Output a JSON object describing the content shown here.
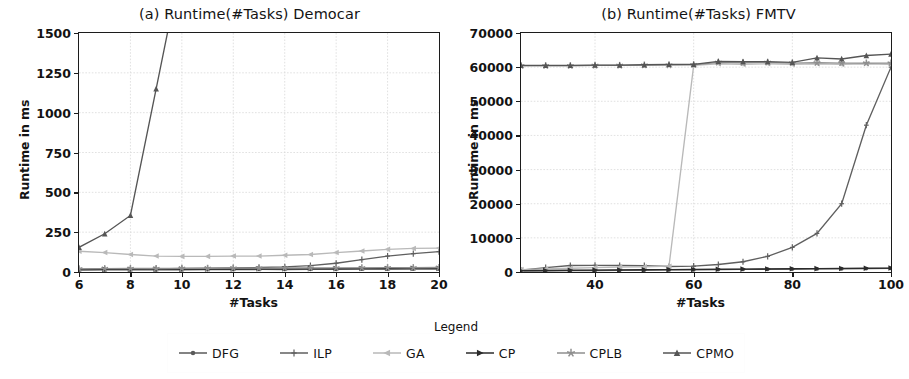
{
  "figure": {
    "legend": {
      "title": "Legend",
      "entries": [
        {
          "label": "DFG",
          "marker": "circle-marker",
          "color": "#5a5a5a"
        },
        {
          "label": "ILP",
          "marker": "plus-marker",
          "color": "#5f5f5f"
        },
        {
          "label": "GA",
          "marker": "triangle-left-marker",
          "color": "#b9b9b9"
        },
        {
          "label": "CP",
          "marker": "triangle-right-marker",
          "color": "#2b2b2b"
        },
        {
          "label": "CPLB",
          "marker": "star-marker",
          "color": "#8f8f8f"
        },
        {
          "label": "CPMO",
          "marker": "triangle-up-marker",
          "color": "#555555"
        }
      ]
    }
  },
  "chart_data": [
    {
      "id": "panel-a",
      "type": "line",
      "title": "(a) Runtime(#Tasks) Democar",
      "xlabel": "#Tasks",
      "ylabel": "Runtime in ms",
      "xlim": [
        6,
        20
      ],
      "ylim": [
        0,
        1500
      ],
      "xticks": [
        6,
        8,
        10,
        12,
        14,
        16,
        18,
        20
      ],
      "yticks": [
        0,
        250,
        500,
        750,
        1000,
        1250,
        1500
      ],
      "grid": true,
      "legend_position": "below-figure",
      "x": [
        6,
        7,
        8,
        9,
        10,
        11,
        12,
        13,
        14,
        15,
        16,
        17,
        18,
        19,
        20
      ],
      "series": [
        {
          "name": "DFG",
          "marker": "circle-marker",
          "color": "#5a5a5a",
          "values": [
            12,
            13,
            13,
            14,
            14,
            15,
            15,
            16,
            16,
            17,
            17,
            18,
            18,
            19,
            19
          ]
        },
        {
          "name": "ILP",
          "marker": "plus-marker",
          "color": "#5f5f5f",
          "values": [
            15,
            17,
            18,
            20,
            22,
            24,
            26,
            28,
            32,
            40,
            55,
            78,
            100,
            115,
            128
          ]
        },
        {
          "name": "GA",
          "marker": "triangle-left-marker",
          "color": "#b9b9b9",
          "values": [
            130,
            122,
            110,
            100,
            98,
            98,
            100,
            100,
            105,
            110,
            122,
            132,
            142,
            148,
            150
          ]
        },
        {
          "name": "CP",
          "marker": "triangle-right-marker",
          "color": "#2b2b2b",
          "values": [
            16,
            17,
            17,
            18,
            18,
            19,
            19,
            20,
            20,
            21,
            21,
            22,
            22,
            23,
            23
          ]
        },
        {
          "name": "CPLB",
          "marker": "star-marker",
          "color": "#8f8f8f",
          "values": [
            20,
            21,
            22,
            22,
            23,
            23,
            24,
            24,
            25,
            25,
            26,
            26,
            27,
            27,
            28
          ]
        },
        {
          "name": "CPMO",
          "marker": "triangle-up-marker",
          "color": "#555555",
          "values": [
            155,
            240,
            355,
            1150,
            null,
            null,
            null,
            null,
            null,
            null,
            null,
            null,
            null,
            null,
            null
          ]
        }
      ],
      "notes": "CPMO exceeds the 1500 ms axis maximum beyond #Tasks 9."
    },
    {
      "id": "panel-b",
      "type": "line",
      "title": "(b) Runtime(#Tasks) FMTV",
      "xlabel": "#Tasks",
      "ylabel": "Runtime in ms",
      "xlim": [
        25,
        100
      ],
      "ylim": [
        0,
        70000
      ],
      "xticks": [
        40,
        60,
        80,
        100
      ],
      "yticks": [
        0,
        10000,
        20000,
        30000,
        40000,
        50000,
        60000,
        70000
      ],
      "grid": true,
      "legend_position": "below-figure",
      "x": [
        25,
        30,
        35,
        40,
        45,
        50,
        55,
        60,
        65,
        70,
        75,
        80,
        85,
        90,
        95,
        100
      ],
      "series": [
        {
          "name": "DFG",
          "marker": "circle-marker",
          "color": "#5a5a5a",
          "values": [
            300,
            350,
            400,
            450,
            500,
            550,
            600,
            650,
            700,
            750,
            800,
            850,
            900,
            950,
            1000,
            1050
          ]
        },
        {
          "name": "ILP",
          "marker": "plus-marker",
          "color": "#5f5f5f",
          "values": [
            500,
            1300,
            1900,
            1950,
            1900,
            1850,
            1600,
            1700,
            2200,
            3000,
            4600,
            7200,
            11300,
            20000,
            43000,
            60000
          ]
        },
        {
          "name": "GA",
          "marker": "triangle-left-marker",
          "color": "#b9b9b9",
          "values": [
            700,
            900,
            1100,
            1300,
            1450,
            1550,
            1700,
            60500,
            61000,
            60800,
            61000,
            60800,
            61000,
            60800,
            61000,
            60800
          ]
        },
        {
          "name": "CP",
          "marker": "triangle-right-marker",
          "color": "#2b2b2b",
          "values": [
            400,
            450,
            500,
            550,
            600,
            650,
            700,
            750,
            800,
            850,
            900,
            950,
            1000,
            1050,
            1100,
            1150
          ]
        },
        {
          "name": "CPLB",
          "marker": "star-marker",
          "color": "#8f8f8f",
          "values": [
            60400,
            60400,
            60400,
            60500,
            60500,
            60600,
            60600,
            60700,
            61400,
            61300,
            61400,
            61200,
            61300,
            61200,
            61200,
            61200
          ]
        },
        {
          "name": "CPMO",
          "marker": "triangle-up-marker",
          "color": "#555555",
          "values": [
            60500,
            60500,
            60500,
            60600,
            60600,
            60700,
            60800,
            60800,
            61700,
            61600,
            61600,
            61400,
            62700,
            62400,
            63400,
            63800
          ]
        }
      ],
      "notes": "CPLB and CPMO remain at the 60 s timeout for all task counts; GA hits the timeout from #Tasks 60."
    }
  ]
}
